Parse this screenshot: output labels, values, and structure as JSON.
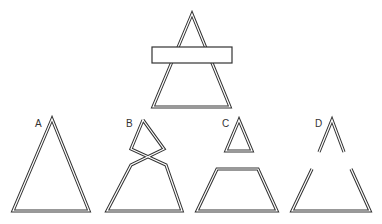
{
  "figure": {
    "type": "occlusion-completion-diagram",
    "top": {
      "description": "Triangle outline partially occluded by a horizontal rectangle",
      "triangle": {
        "apex": [
          192,
          14
        ],
        "base_left": [
          153,
          107
        ],
        "base_right": [
          230,
          107
        ]
      },
      "occluder": {
        "x": 152,
        "y": 47,
        "width": 80,
        "height": 16
      }
    },
    "options": [
      {
        "label": "A",
        "description": "Complete triangle"
      },
      {
        "label": "B",
        "description": "Triangle with crossed sides forming a diamond top"
      },
      {
        "label": "C",
        "description": "Small separate triangle above a trapezoid"
      },
      {
        "label": "D",
        "description": "Broken triangle with gaps in both sides"
      }
    ],
    "colors": {
      "line": "#333333",
      "background": "#ffffff"
    }
  }
}
